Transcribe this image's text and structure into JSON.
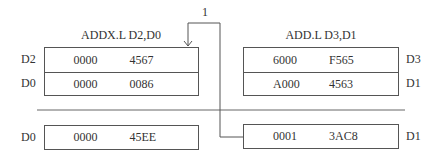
{
  "diagram": {
    "connector_label": "1",
    "left_panel": {
      "instruction": "ADDX.L D2,D0",
      "rows": [
        {
          "label": "D2",
          "high": "0000",
          "low": "4567"
        },
        {
          "label": "D0",
          "high": "0000",
          "low": "0086"
        }
      ],
      "result": {
        "label": "D0",
        "high": "0000",
        "low": "45EE"
      }
    },
    "right_panel": {
      "instruction": "ADD.L D3,D1",
      "rows": [
        {
          "label": "D3",
          "high": "6000",
          "low": "F565"
        },
        {
          "label": "D1",
          "high": "A000",
          "low": "4563"
        }
      ],
      "result": {
        "label": "D1",
        "high": "0001",
        "low": "3AC8"
      }
    },
    "colors": {
      "line": "#555555",
      "text": "#333333",
      "background": "#ffffff"
    }
  }
}
